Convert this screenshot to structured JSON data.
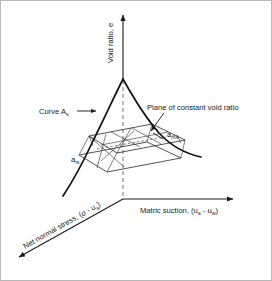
{
  "figure": {
    "type": "3d-constitutive-surface-diagram",
    "background_color": "#ffffff",
    "line_color": "#111111",
    "dashed_axis_color": "#767676"
  },
  "axes": {
    "vertical": {
      "label": "Void ratio, e",
      "name": "void-ratio-axis",
      "orientation": "vertical-up",
      "arrow": true
    },
    "horizontal_right": {
      "label_prefix": "Matric suction, (u",
      "label_sub1": "a",
      "label_mid": " - u",
      "label_sub2": "w",
      "label_suffix": ")",
      "label_full": "Matric suction, (ua - uw)",
      "name": "matric-suction-axis",
      "orientation": "horizontal-right",
      "arrow": true
    },
    "diagonal_left": {
      "label_prefix": "Net normal stress, (",
      "label_sigma": "σ",
      "label_mid": " - u",
      "label_sub": "a",
      "label_suffix": ")",
      "label_full": "Net normal stress, (σ - ua)",
      "name": "net-normal-stress-axis",
      "orientation": "diagonal-down-left",
      "arrow": true
    }
  },
  "annotations": {
    "curve_a": {
      "text": "Curve A",
      "subscript": "s",
      "name": "curve-a-label",
      "has_leader_arrow": true
    },
    "plane": {
      "text": "Plane of constant void ratio",
      "name": "plane-of-constant-void-ratio-label",
      "has_leader_arrow": true
    },
    "a_ts": {
      "text": "a",
      "subscript": "ts",
      "name": "a-ts-label"
    },
    "a_ms": {
      "text": "a",
      "subscript": "ms",
      "name": "a-ms-label"
    }
  },
  "geometry": {
    "origin": {
      "x": 122,
      "y": 198
    },
    "apex": {
      "x": 122,
      "y": 77
    },
    "vertical_axis_top": {
      "x": 122,
      "y": 12
    },
    "matric_axis_end": {
      "x": 235,
      "y": 198
    },
    "net_stress_axis_end": {
      "x": 14,
      "y": 258
    }
  }
}
